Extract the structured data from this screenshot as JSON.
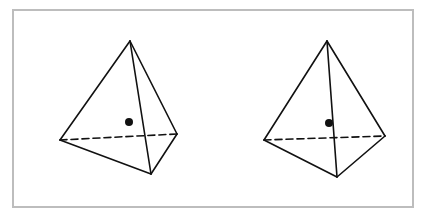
{
  "diagram": {
    "frame": {
      "x": 13,
      "y": 10,
      "width": 400,
      "height": 197,
      "stroke": "#bdbdbd"
    },
    "line_color": "#111111",
    "tetrahedra": [
      {
        "id": "left",
        "apex": [
          130,
          41
        ],
        "left": [
          60,
          140
        ],
        "right": [
          177,
          134
        ],
        "bottom": [
          151,
          174
        ],
        "dot": [
          129,
          122
        ],
        "hidden_edge": "left-right"
      },
      {
        "id": "right",
        "apex": [
          327,
          41
        ],
        "left": [
          264,
          140
        ],
        "right": [
          385,
          136
        ],
        "bottom": [
          337,
          177
        ],
        "dot": [
          329,
          123
        ],
        "hidden_edge": "left-right"
      }
    ]
  }
}
